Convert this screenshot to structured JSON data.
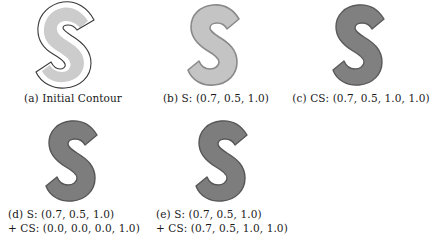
{
  "figure": {
    "background_color": "#ffffff",
    "panels": [
      {
        "id": "a",
        "label": "(a) Initial Contour",
        "caption_lines": [
          "(a) Initial Contour"
        ],
        "shape": "s-contour",
        "fill_color": "#cccccc",
        "outline_color": "#3a3a3a",
        "has_outer_contour": true,
        "outer_gap_color": "#ffffff"
      },
      {
        "id": "b",
        "label": "(b) S: (0.7, 0.5, 1.0)",
        "caption_lines": [
          "(b) S: (0.7, 0.5, 1.0)"
        ],
        "shape": "s-contour",
        "fill_color": "#c4c4c4",
        "outline_color": "#8a8a8a",
        "has_outer_contour": false,
        "params": {
          "S": [
            0.7,
            0.5,
            1.0
          ]
        }
      },
      {
        "id": "c",
        "label": "(c) CS: (0.7, 0.5, 1.0, 1.0)",
        "caption_lines": [
          "(c) CS: (0.7, 0.5, 1.0, 1.0)"
        ],
        "shape": "s-contour",
        "fill_color": "#808080",
        "outline_color": "#5a5a5a",
        "has_outer_contour": false,
        "params": {
          "CS": [
            0.7,
            0.5,
            1.0,
            1.0
          ]
        }
      },
      {
        "id": "d",
        "label": "(d) S: (0.7, 0.5, 1.0) + CS: (0.0, 0.0, 0.0, 1.0)",
        "caption_lines": [
          "(d) S: (0.7, 0.5, 1.0)",
          "+ CS: (0.0, 0.0, 0.0, 1.0)"
        ],
        "shape": "s-contour",
        "fill_color": "#7d7d7d",
        "outline_color": "#575757",
        "has_outer_contour": false,
        "params": {
          "S": [
            0.7,
            0.5,
            1.0
          ],
          "CS": [
            0.0,
            0.0,
            0.0,
            1.0
          ]
        }
      },
      {
        "id": "e",
        "label": "(e) S: (0.7, 0.5, 1.0) + CS: (0.7, 0.5, 1.0, 1.0)",
        "caption_lines": [
          "(e) S: (0.7, 0.5, 1.0)",
          "+ CS: (0.7, 0.5, 1.0, 1.0)"
        ],
        "shape": "s-contour",
        "fill_color": "#7d7d7d",
        "outline_color": "#575757",
        "has_outer_contour": false,
        "params": {
          "S": [
            0.7,
            0.5,
            1.0
          ],
          "CS": [
            0.7,
            0.5,
            1.0,
            1.0
          ]
        }
      }
    ]
  }
}
